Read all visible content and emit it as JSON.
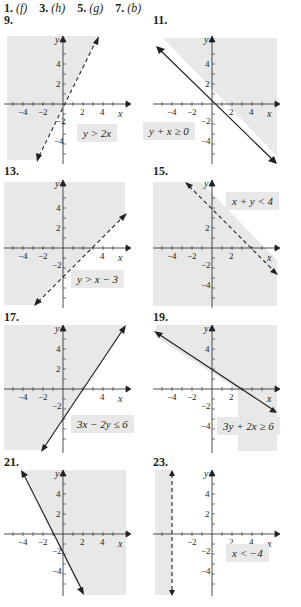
{
  "answers": [
    {
      "num": "1.",
      "ans": "(f)"
    },
    {
      "num": "3.",
      "ans": "(h)"
    },
    {
      "num": "5.",
      "ans": "(g)"
    },
    {
      "num": "7.",
      "ans": "(b)"
    }
  ],
  "axis": {
    "x_label": "x",
    "y_label": "y",
    "ticks": [
      "−4",
      "−2",
      "2",
      "4"
    ]
  },
  "colors": {
    "shade": "#e8e8e8",
    "line": "#231f20"
  },
  "problems": [
    {
      "num": "9.",
      "inequality": "y > 2x",
      "boundary": "dashed",
      "shaded": "above-left"
    },
    {
      "num": "11.",
      "inequality": "y + x ≥ 0",
      "boundary": "solid",
      "shaded": "above-right"
    },
    {
      "num": "13.",
      "inequality": "y > x − 3",
      "boundary": "dashed",
      "shaded": "above-left"
    },
    {
      "num": "15.",
      "inequality": "x + y < 4",
      "boundary": "dashed",
      "shaded": "below-left"
    },
    {
      "num": "17.",
      "inequality": "3x − 2y ≤ 6",
      "boundary": "solid",
      "shaded": "above-left"
    },
    {
      "num": "19.",
      "inequality": "3y + 2x ≥ 6",
      "boundary": "solid",
      "shaded": "above-right"
    },
    {
      "num": "21.",
      "inequality": "",
      "boundary": "solid",
      "shaded": "right"
    },
    {
      "num": "23.",
      "inequality": "x < −4",
      "boundary": "dashed",
      "shaded": "left"
    }
  ]
}
